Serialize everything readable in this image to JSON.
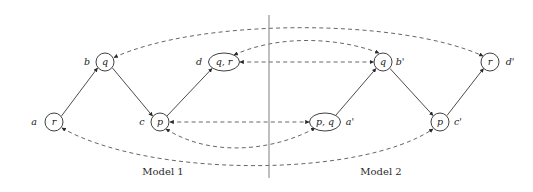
{
  "figure": {
    "caption_left": "Model 1",
    "caption_right": "Model 2",
    "divider_label": "model-divider"
  },
  "colors": {
    "stroke": "#2a2a2a",
    "dashed_stroke": "#4a4a4a",
    "divider": "#8a8a8a",
    "background": "#ffffff",
    "text": "#1a1a1a"
  },
  "nodes": {
    "model1": [
      {
        "id": "a",
        "name_label": "a",
        "valuation": "r",
        "cx": 54,
        "cy": 122,
        "rx": 9,
        "ry": 9,
        "name_x": 34,
        "name_y": 122,
        "shape": "circle"
      },
      {
        "id": "b",
        "name_label": "b",
        "valuation": "q",
        "cx": 105,
        "cy": 62,
        "rx": 9,
        "ry": 9,
        "name_x": 87,
        "name_y": 62,
        "shape": "circle"
      },
      {
        "id": "c",
        "name_label": "c",
        "valuation": "p",
        "cx": 160,
        "cy": 122,
        "rx": 9,
        "ry": 9,
        "name_x": 142,
        "name_y": 122,
        "shape": "circle"
      },
      {
        "id": "d",
        "name_label": "d",
        "valuation": "q, r",
        "cx": 224,
        "cy": 62,
        "rx": 15.5,
        "ry": 9,
        "name_x": 199,
        "name_y": 62,
        "shape": "ellipse"
      }
    ],
    "model2": [
      {
        "id": "ap",
        "name_label": "a'",
        "valuation": "p, q",
        "cx": 325,
        "cy": 122,
        "rx": 15.5,
        "ry": 9,
        "name_x": 348,
        "name_y": 122,
        "shape": "ellipse"
      },
      {
        "id": "bp",
        "name_label": "b'",
        "valuation": "q",
        "cx": 383,
        "cy": 62,
        "rx": 9,
        "ry": 9,
        "name_x": 398,
        "name_y": 62,
        "shape": "circle"
      },
      {
        "id": "cp",
        "name_label": "c'",
        "valuation": "p",
        "cx": 440,
        "cy": 122,
        "rx": 9,
        "ry": 9,
        "name_x": 456,
        "name_y": 122,
        "shape": "circle"
      },
      {
        "id": "dp",
        "name_label": "d'",
        "valuation": "r",
        "cx": 490,
        "cy": 62,
        "rx": 9,
        "ry": 9,
        "name_x": 508,
        "name_y": 62,
        "shape": "circle"
      }
    ]
  },
  "edges": {
    "solid": [
      {
        "id": "a-b",
        "from": "a",
        "to": "b",
        "d": "M 61.5,116 L 97.5,68"
      },
      {
        "id": "b-c",
        "from": "b",
        "to": "c",
        "d": "M 112.5,68 L 152.5,116"
      },
      {
        "id": "c-d",
        "from": "c",
        "to": "d",
        "d": "M 167,116 L 212,68.5"
      },
      {
        "id": "ap-bp",
        "from": "ap",
        "to": "bp",
        "d": "M 336,115 L 376,68.5"
      },
      {
        "id": "bp-cp",
        "from": "bp",
        "to": "cp",
        "d": "M 390,68.5 L 433,115.5"
      },
      {
        "id": "cp-dp",
        "from": "cp",
        "to": "dp",
        "d": "M 447,115.5 L 483.5,68.5"
      }
    ],
    "dashed": [
      {
        "id": "d-bp-horizontal",
        "from": "d",
        "to": "bp",
        "d": "M 240,62 L 373.5,62",
        "arrows": "both"
      },
      {
        "id": "c-ap-horizontal",
        "from": "c",
        "to": "ap",
        "d": "M 170,122 L 309,122",
        "arrows": "both"
      },
      {
        "id": "b-dp-arc-top",
        "from": "b",
        "to": "dp",
        "d": "M 114,57.5 C 200,18 400,18 483,56",
        "arrows": "both"
      },
      {
        "id": "d-bp-arc-upper",
        "from": "d",
        "to": "bp",
        "d": "M 234,55 C 280,34 340,38 379,53",
        "arrows": "both"
      },
      {
        "id": "a-cp-arc-bottom",
        "from": "a",
        "to": "cp",
        "d": "M 62,128 C 150,178 360,178 433,129",
        "arrows": "both"
      },
      {
        "id": "c-ap-arc-lower",
        "from": "c",
        "to": "ap",
        "d": "M 166,129 C 215,160 280,148 315,128",
        "arrows": "both"
      }
    ]
  }
}
